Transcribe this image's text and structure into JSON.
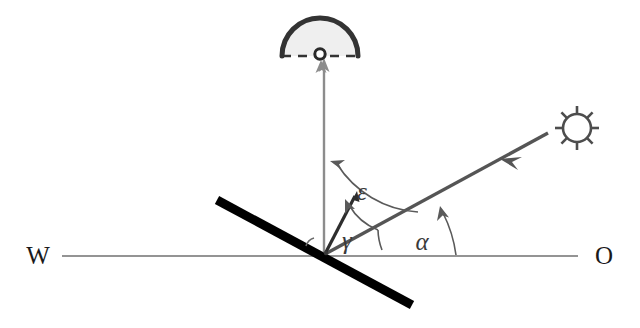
{
  "diagram": {
    "title": "Solar incidence angle geometry on a tilted surface",
    "background_color": "#ffffff",
    "canvas": {
      "width": 640,
      "height": 328
    },
    "labels": {
      "west": "W",
      "east": "O",
      "epsilon": "ε",
      "gamma": "γ",
      "alpha": "α"
    },
    "colors": {
      "horizon_line": "#707070",
      "surface_line": "#000000",
      "ray_line": "#555555",
      "zenith_line": "#8c8c8c",
      "arc_line": "#5a5a5a",
      "dome_stroke": "#333333",
      "dome_fill": "#efefef",
      "sun_stroke": "#4d4d4d",
      "text": "#1a1a1a"
    },
    "elements": {
      "horizon": {
        "name": "horizon-line",
        "x1": 62,
        "y1": 256,
        "x2": 578,
        "y2": 256
      },
      "surface": {
        "name": "tilted-surface-line",
        "x1": 217,
        "y1": 200,
        "x2": 410,
        "y2": 304,
        "width": 8
      },
      "zenith": {
        "name": "zenith-axis",
        "x1": 324,
        "y1": 252,
        "x2": 324,
        "y2": 62
      },
      "sun_ray": {
        "name": "solar-ray",
        "x1": 327,
        "y1": 253,
        "x2": 545,
        "y2": 135
      },
      "normal": {
        "name": "surface-normal-arrow",
        "x1": 326,
        "y1": 253,
        "x2": 353,
        "y2": 198
      },
      "dome": {
        "name": "sky-dome",
        "cx": 320,
        "cy": 55,
        "r": 38
      },
      "sun": {
        "name": "sun-symbol",
        "cx": 577,
        "cy": 128,
        "r": 14,
        "rays": 8
      }
    },
    "angles": [
      {
        "symbol": "ε",
        "name": "epsilon-zenith-angle",
        "label_x": 362,
        "label_y": 192
      },
      {
        "symbol": "γ",
        "name": "gamma-incidence-angle",
        "label_x": 347,
        "label_y": 243
      },
      {
        "symbol": "α",
        "name": "alpha-solar-altitude",
        "label_x": 420,
        "label_y": 243
      }
    ]
  }
}
